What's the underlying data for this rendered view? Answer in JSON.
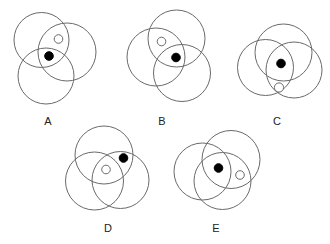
{
  "figures": [
    {
      "label": "A",
      "circles": [
        {
          "cx": 41.5,
          "cy": 40,
          "r": 27.5
        },
        {
          "cx": 67,
          "cy": 52,
          "r": 29
        },
        {
          "cx": 46,
          "cy": 76,
          "r": 28
        }
      ],
      "hollow_dot": {
        "cx": 58.5,
        "cy": 39,
        "r": 4.3
      },
      "filled_dot": {
        "cx": 49,
        "cy": 56,
        "r": 4.3
      },
      "label_pos": {
        "x": 48,
        "y": 125
      }
    },
    {
      "label": "B",
      "circles": [
        {
          "cx": 176.5,
          "cy": 38.5,
          "r": 28.5
        },
        {
          "cx": 156,
          "cy": 57,
          "r": 29
        },
        {
          "cx": 182,
          "cy": 73,
          "r": 28.5
        }
      ],
      "hollow_dot": {
        "cx": 161.5,
        "cy": 41.5,
        "r": 4.3
      },
      "filled_dot": {
        "cx": 176,
        "cy": 57.5,
        "r": 4.3
      },
      "label_pos": {
        "x": 162,
        "y": 125
      }
    },
    {
      "label": "C",
      "circles": [
        {
          "cx": 283.5,
          "cy": 52.5,
          "r": 28.5
        },
        {
          "cx": 265.5,
          "cy": 67.5,
          "r": 28
        },
        {
          "cx": 294,
          "cy": 70,
          "r": 28
        }
      ],
      "hollow_dot": {
        "cx": 279,
        "cy": 87.5,
        "r": 4.6
      },
      "filled_dot": {
        "cx": 281,
        "cy": 63.5,
        "r": 4.3
      },
      "label_pos": {
        "x": 277,
        "y": 125
      }
    },
    {
      "label": "D",
      "circles": [
        {
          "cx": 104,
          "cy": 155,
          "r": 29
        },
        {
          "cx": 94.5,
          "cy": 181,
          "r": 29
        },
        {
          "cx": 120.5,
          "cy": 180,
          "r": 28.5
        }
      ],
      "hollow_dot": {
        "cx": 106,
        "cy": 169.5,
        "r": 4.3
      },
      "filled_dot": {
        "cx": 123.5,
        "cy": 158,
        "r": 4.3
      },
      "label_pos": {
        "x": 108,
        "y": 232
      }
    },
    {
      "label": "E",
      "circles": [
        {
          "cx": 231,
          "cy": 159.5,
          "r": 29
        },
        {
          "cx": 202.5,
          "cy": 171.5,
          "r": 28.5
        },
        {
          "cx": 222.5,
          "cy": 181,
          "r": 28.5
        }
      ],
      "hollow_dot": {
        "cx": 240,
        "cy": 175,
        "r": 4.3
      },
      "filled_dot": {
        "cx": 218.5,
        "cy": 168,
        "r": 4.3
      },
      "label_pos": {
        "x": 216,
        "y": 232
      }
    }
  ],
  "colors": {
    "ring": "#6a6a6a",
    "filled_dot": "#000000",
    "hollow_dot": "#ffffff",
    "label": "#222222"
  }
}
